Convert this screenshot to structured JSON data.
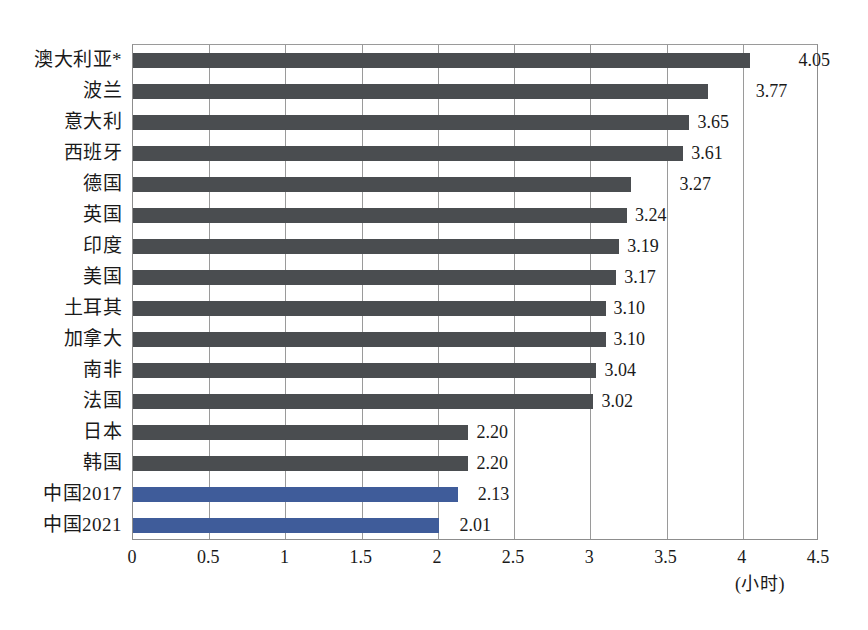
{
  "chart_data": {
    "type": "bar",
    "orientation": "horizontal",
    "title": "",
    "subtitle": "",
    "xlabel": "(小时)",
    "ylabel": "",
    "xlim": [
      0,
      4.5
    ],
    "grid": true,
    "grid_axis": "x",
    "legend": false,
    "legend_position": "none",
    "xticks": [
      "0",
      "0.5",
      "1",
      "1.5",
      "2",
      "2.5",
      "3",
      "3.5",
      "4",
      "4.5"
    ],
    "xtick_values": [
      0,
      0.5,
      1,
      1.5,
      2,
      2.5,
      3,
      3.5,
      4,
      4.5
    ],
    "categories": [
      "澳大利亚*",
      "波兰",
      "意大利",
      "西班牙",
      "德国",
      "英国",
      "印度",
      "美国",
      "土耳其",
      "加拿大",
      "南非",
      "法国",
      "日本",
      "韩国",
      "中国2017",
      "中国2021"
    ],
    "values": [
      4.05,
      3.77,
      3.65,
      3.61,
      3.27,
      3.24,
      3.19,
      3.17,
      3.1,
      3.1,
      3.04,
      3.02,
      2.2,
      2.2,
      2.13,
      2.01
    ],
    "value_labels": [
      "4.05",
      "3.77",
      "3.65",
      "3.61",
      "3.27",
      "3.24",
      "3.19",
      "3.17",
      "3.10",
      "3.10",
      "3.04",
      "3.02",
      "2.20",
      "2.20",
      "2.13",
      "2.01"
    ],
    "bar_colors": [
      "#4a4d50",
      "#4a4d50",
      "#4a4d50",
      "#4a4d50",
      "#4a4d50",
      "#4a4d50",
      "#4a4d50",
      "#4a4d50",
      "#4a4d50",
      "#4a4d50",
      "#4a4d50",
      "#4a4d50",
      "#4a4d50",
      "#4a4d50",
      "#3f5c9a",
      "#3f5c9a"
    ],
    "label_offsets": [
      48,
      48,
      8,
      8,
      48,
      8,
      8,
      8,
      8,
      8,
      8,
      8,
      8,
      8,
      20,
      20
    ],
    "colors": {
      "bar_default": "#4a4d50",
      "bar_highlight": "#3f5c9a",
      "grid": "#9a9a9a",
      "axis": "#8d8d8d",
      "background": "#ffffff",
      "text": "#1a1a1a"
    }
  },
  "footer": {
    "caption": ""
  }
}
